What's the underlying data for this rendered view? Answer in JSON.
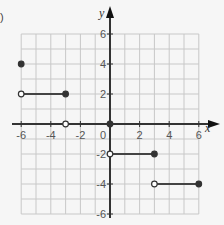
{
  "panel_label": ")",
  "chart_data": {
    "type": "line",
    "title": "",
    "xlabel": "x",
    "ylabel": "y",
    "xlim": [
      -6,
      6
    ],
    "ylim": [
      -6,
      6
    ],
    "grid": true,
    "x_ticks": [
      "-6",
      "-4",
      "-2",
      "0",
      "2",
      "4",
      "6"
    ],
    "y_ticks": [
      "6",
      "4",
      "2",
      "-2",
      "-4",
      "-6"
    ],
    "segments": [
      {
        "x": [
          -6,
          -3
        ],
        "y": [
          2,
          2
        ],
        "start": "open",
        "end": "closed"
      },
      {
        "x": [
          0,
          3
        ],
        "y": [
          -2,
          -2
        ],
        "start": "open",
        "end": "closed"
      },
      {
        "x": [
          3,
          6
        ],
        "y": [
          -4,
          -4
        ],
        "start": "open",
        "end": "closed"
      }
    ],
    "points": [
      {
        "x": -6,
        "y": 4,
        "style": "closed"
      },
      {
        "x": -3,
        "y": 0,
        "style": "open"
      },
      {
        "x": 0,
        "y": 0,
        "style": "closed"
      }
    ]
  }
}
